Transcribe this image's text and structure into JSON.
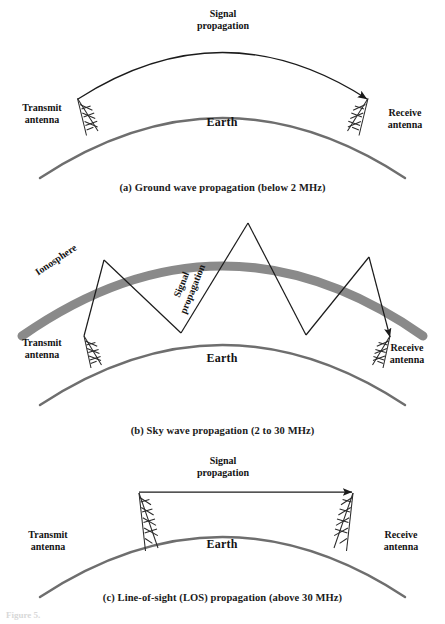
{
  "figure": {
    "faint_footer": "Figure 5."
  },
  "colors": {
    "earth_arc": "#6e6e6e",
    "ionosphere_band": "#8a8a8a",
    "ray_line": "#1b1b1b",
    "antenna": "#2a2a2a",
    "text": "#131313",
    "background": "#ffffff"
  },
  "panels": [
    {
      "id": "a",
      "caption": "(a) Ground wave propagation (below 2 MHz)",
      "mode": "ground-wave",
      "frequency_range": "below 2 MHz",
      "labels": {
        "transmit": "Transmit\nantenna",
        "receive": "Receive\nantenna",
        "earth": "Earth",
        "signal": "Signal\npropagation"
      }
    },
    {
      "id": "b",
      "caption": "(b) Sky wave propagation (2 to 30 MHz)",
      "mode": "sky-wave",
      "frequency_range": "2 to 30 MHz",
      "labels": {
        "transmit": "Transmit\nantenna",
        "receive": "Receive\nantenna",
        "earth": "Earth",
        "signal": "Signal\npropagation",
        "ionosphere": "Ionosphere"
      }
    },
    {
      "id": "c",
      "caption": "(c) Line-of-sight (LOS) propagation (above 30 MHz)",
      "mode": "line-of-sight",
      "frequency_range": "above 30 MHz",
      "labels": {
        "transmit": "Transmit\nantenna",
        "receive": "Receive\nantenna",
        "earth": "Earth",
        "signal": "Signal\npropagation"
      }
    }
  ]
}
